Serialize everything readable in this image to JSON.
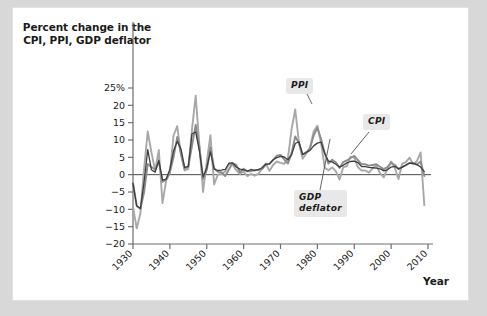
{
  "figure": {
    "axis_title": "Percent change in\nthe CPI, PPI, GDP\ndeflator",
    "xaxis_label": "Year",
    "callouts": {
      "ppi": "PPI",
      "cpi": "CPI",
      "gdp": "GDP\ndeflator"
    }
  },
  "chart_data": {
    "type": "line",
    "title": "Percent change in the CPI, PPI, GDP deflator",
    "xlabel": "Year",
    "ylabel": "Percent change in the CPI, PPI, GDP deflator",
    "xlim": [
      1930,
      2010
    ],
    "ylim": [
      -20,
      25
    ],
    "ytick_labels": [
      "25%",
      "20",
      "15",
      "10",
      "5",
      "0",
      "-5",
      "-10",
      "-15",
      "-20"
    ],
    "ytick_values": [
      25,
      20,
      15,
      10,
      5,
      0,
      -5,
      -10,
      -15,
      -20
    ],
    "xtick_values": [
      1930,
      1940,
      1950,
      1960,
      1970,
      1980,
      1990,
      2000,
      2010
    ],
    "xtick_labels": [
      "1930",
      "1940",
      "1950",
      "1960",
      "1970",
      "1980",
      "1990",
      "2000",
      "2010"
    ],
    "grid": false,
    "zero_line": true,
    "legend_position": "inline-callouts",
    "colors": {
      "cpi": "#8c8c8c",
      "ppi": "#a8a8a8",
      "gdp_deflator": "#3d3d3d",
      "axis": "#6e6e6e",
      "panel_background": "#ffffff",
      "page_background": "#d8d8d8",
      "callout_background": "#e8e8e8",
      "text": "#1b1b1b"
    },
    "x": [
      1930,
      1931,
      1932,
      1933,
      1934,
      1935,
      1936,
      1937,
      1938,
      1939,
      1940,
      1941,
      1942,
      1943,
      1944,
      1945,
      1946,
      1947,
      1948,
      1949,
      1950,
      1951,
      1952,
      1953,
      1954,
      1955,
      1956,
      1957,
      1958,
      1959,
      1960,
      1961,
      1962,
      1963,
      1964,
      1965,
      1966,
      1967,
      1968,
      1969,
      1970,
      1971,
      1972,
      1973,
      1974,
      1975,
      1976,
      1977,
      1978,
      1979,
      1980,
      1981,
      1982,
      1983,
      1984,
      1985,
      1986,
      1987,
      1988,
      1989,
      1990,
      1991,
      1992,
      1993,
      1994,
      1995,
      1996,
      1997,
      1998,
      1999,
      2000,
      2001,
      2002,
      2003,
      2004,
      2005,
      2006,
      2007,
      2008,
      2009
    ],
    "series": [
      {
        "name": "CPI",
        "values": [
          -2.3,
          -9.0,
          -9.9,
          -5.1,
          3.1,
          2.2,
          1.5,
          3.6,
          -2.1,
          -1.4,
          0.7,
          5.0,
          10.9,
          6.1,
          1.7,
          2.3,
          8.3,
          14.4,
          8.1,
          -1.2,
          1.3,
          7.9,
          1.9,
          0.8,
          0.7,
          -0.4,
          1.5,
          3.3,
          2.8,
          0.7,
          1.7,
          1.0,
          1.0,
          1.3,
          1.3,
          1.6,
          2.9,
          3.1,
          4.2,
          5.5,
          5.7,
          4.4,
          3.2,
          6.2,
          11.0,
          9.1,
          5.8,
          6.5,
          7.6,
          11.3,
          13.5,
          10.3,
          6.2,
          3.2,
          4.3,
          3.6,
          1.9,
          3.6,
          4.1,
          4.8,
          5.4,
          4.2,
          3.0,
          3.0,
          2.6,
          2.8,
          3.0,
          2.3,
          1.6,
          2.2,
          3.4,
          2.8,
          1.6,
          2.3,
          2.7,
          3.4,
          3.2,
          2.9,
          3.8,
          -0.4
        ]
      },
      {
        "name": "PPI",
        "values": [
          -9.2,
          -15.5,
          -11.2,
          1.7,
          12.5,
          6.4,
          1.2,
          7.1,
          -8.2,
          -1.6,
          0.5,
          11.3,
          14.0,
          5.8,
          1.2,
          1.7,
          13.1,
          22.8,
          8.5,
          -5.0,
          3.6,
          11.4,
          -2.8,
          0.0,
          0.2,
          0.9,
          3.0,
          2.9,
          1.3,
          0.2,
          0.9,
          -0.4,
          0.2,
          -0.3,
          0.2,
          1.8,
          3.2,
          1.1,
          2.8,
          3.8,
          3.4,
          3.1,
          4.6,
          13.1,
          18.8,
          9.2,
          4.6,
          6.1,
          7.8,
          12.5,
          14.1,
          9.1,
          2.0,
          1.3,
          2.1,
          1.0,
          -1.4,
          2.1,
          2.5,
          5.2,
          4.9,
          2.1,
          1.2,
          1.2,
          0.6,
          1.9,
          2.6,
          0.4,
          -0.8,
          1.8,
          3.8,
          2.0,
          -1.3,
          3.2,
          3.6,
          4.9,
          3.0,
          3.9,
          6.4,
          -8.8
        ]
      },
      {
        "name": "GDP deflator",
        "values": [
          -2.6,
          -9.0,
          -9.7,
          -2.2,
          7.2,
          1.4,
          0.7,
          4.2,
          -1.6,
          -1.3,
          1.6,
          6.9,
          9.6,
          7.5,
          2.1,
          2.4,
          11.8,
          12.3,
          6.9,
          -0.6,
          2.0,
          6.6,
          1.6,
          1.2,
          1.3,
          1.5,
          3.3,
          3.4,
          2.2,
          1.6,
          1.4,
          1.0,
          1.5,
          1.2,
          1.5,
          2.0,
          3.0,
          3.1,
          4.3,
          4.9,
          5.3,
          5.1,
          4.3,
          5.7,
          9.0,
          9.5,
          5.8,
          6.4,
          7.0,
          8.3,
          9.1,
          9.4,
          6.1,
          3.9,
          3.7,
          3.0,
          2.2,
          2.7,
          3.4,
          3.8,
          3.9,
          3.5,
          2.3,
          2.3,
          2.1,
          2.0,
          1.9,
          1.7,
          1.1,
          1.4,
          2.2,
          2.4,
          1.7,
          2.1,
          2.8,
          3.3,
          3.3,
          2.9,
          2.2,
          0.9
        ]
      }
    ]
  }
}
